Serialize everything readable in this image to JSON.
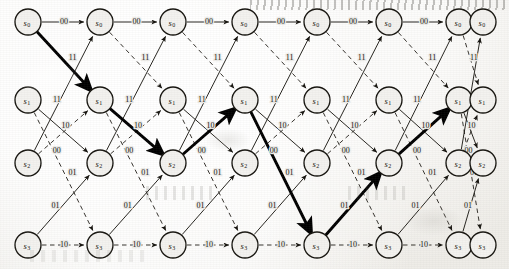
{
  "figure": {
    "kind": "trellis-diagram",
    "title": "",
    "width": 509,
    "height": 269,
    "background_color": "#efeeea",
    "ink_color": "#14120d",
    "highlight_color": "#000000"
  },
  "states": [
    {
      "id": "s0",
      "label": "s",
      "subscript": "0",
      "row_y": 22
    },
    {
      "id": "s1",
      "label": "s",
      "subscript": "1",
      "row_y": 100
    },
    {
      "id": "s2",
      "label": "s",
      "subscript": "2",
      "row_y": 163
    },
    {
      "id": "s3",
      "label": "s",
      "subscript": "3",
      "row_y": 245
    }
  ],
  "columns": [
    {
      "index": 0,
      "x": 28
    },
    {
      "index": 1,
      "x": 100
    },
    {
      "index": 2,
      "x": 173
    },
    {
      "index": 3,
      "x": 245
    },
    {
      "index": 4,
      "x": 317
    },
    {
      "index": 5,
      "x": 389
    },
    {
      "index": 6,
      "x": 459
    },
    {
      "index": 7,
      "x": 483
    }
  ],
  "node_radius": 13,
  "edge_labels": {
    "s0_s0": "00",
    "s0_s1": "11",
    "s1_s2": "10",
    "s1_s3": "01",
    "s2_s0": "11",
    "s2_s1": "00",
    "s3_s2": "01",
    "s3_s3": "10"
  },
  "edge_styles": {
    "solid": "input bit 0 branch",
    "dashed": "input bit 1 branch",
    "bold": "survivor / maximum-likelihood path"
  },
  "survivor_path": {
    "states": [
      "s0",
      "s1",
      "s2",
      "s1",
      "s3",
      "s2",
      "s1",
      "s0"
    ],
    "output_labels": [
      "11",
      "10",
      "00",
      "01",
      "01",
      "00",
      "11"
    ],
    "start_column": 0,
    "end_column": 7
  },
  "columns_count": 8,
  "stages_count": 7
}
